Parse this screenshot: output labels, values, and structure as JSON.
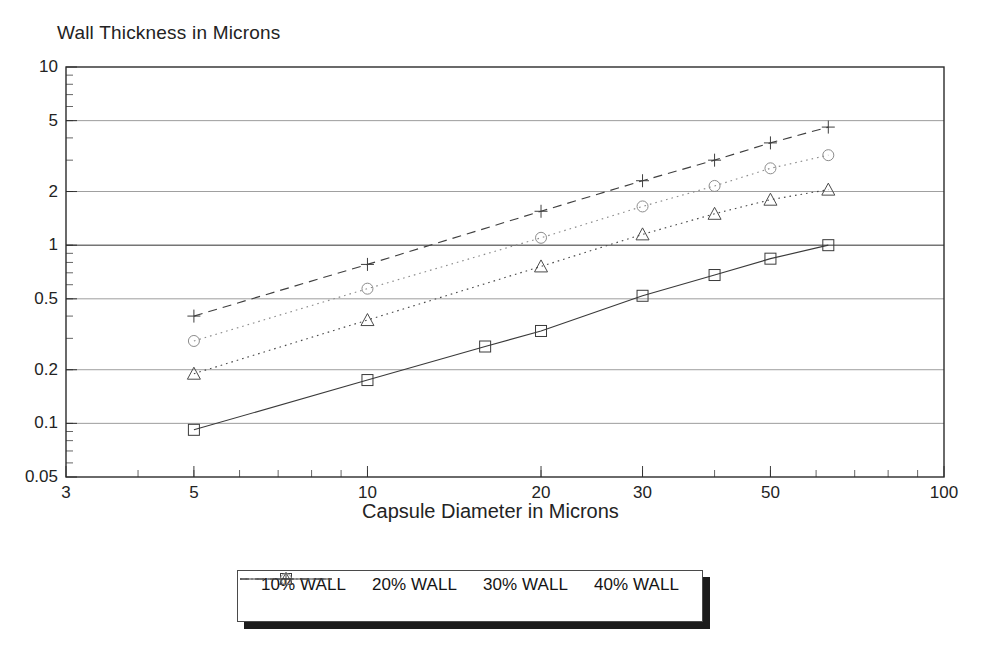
{
  "chart_data": {
    "type": "line",
    "title": "Wall Thickness in Microns",
    "xlabel": "Capsule Diameter in Microns",
    "ylabel": "Wall Thickness in Microns",
    "xscale": "log",
    "yscale": "log",
    "xlim": [
      3,
      100
    ],
    "ylim": [
      0.05,
      10
    ],
    "grid": true,
    "legend_position": "below-center",
    "xticks": [
      3,
      5,
      10,
      20,
      30,
      50,
      100
    ],
    "xtick_labels": [
      "3",
      "5",
      "10",
      "20",
      "30",
      "50",
      "100"
    ],
    "yticks": [
      0.05,
      0.1,
      0.2,
      0.5,
      1,
      2,
      5,
      10
    ],
    "ytick_labels": [
      "0.05",
      "0.1",
      "0.2",
      "0.5",
      "1",
      "2",
      "5",
      "10"
    ],
    "series": [
      {
        "name": "10% WALL",
        "marker": "square",
        "linestyle": "solid",
        "color": "#3a3a3a",
        "x": [
          5,
          10,
          16,
          20,
          30,
          40,
          50,
          63
        ],
        "y": [
          0.092,
          0.175,
          0.27,
          0.33,
          0.52,
          0.68,
          0.84,
          1.0
        ]
      },
      {
        "name": "20% WALL",
        "marker": "triangle",
        "linestyle": "dotted",
        "color": "#4a4a4a",
        "x": [
          5,
          10,
          20,
          30,
          40,
          50,
          63
        ],
        "y": [
          0.19,
          0.38,
          0.76,
          1.15,
          1.5,
          1.8,
          2.05
        ]
      },
      {
        "name": "30% WALL",
        "marker": "circle",
        "linestyle": "dotted",
        "color": "#8c8c8c",
        "x": [
          5,
          10,
          20,
          30,
          40,
          50,
          63
        ],
        "y": [
          0.29,
          0.57,
          1.1,
          1.65,
          2.15,
          2.7,
          3.2
        ]
      },
      {
        "name": "40% WALL",
        "marker": "plus",
        "linestyle": "dashed",
        "color": "#3f3f3f",
        "x": [
          5,
          10,
          20,
          30,
          40,
          50,
          63
        ],
        "y": [
          0.4,
          0.78,
          1.55,
          2.3,
          3.0,
          3.75,
          4.6
        ]
      }
    ]
  },
  "legend": {
    "items": [
      {
        "label": "10% WALL",
        "marker": "square-marker-icon",
        "linestyle": "solid"
      },
      {
        "label": "20% WALL",
        "marker": "triangle-marker-icon",
        "linestyle": "dotted"
      },
      {
        "label": "30% WALL",
        "marker": "circle-marker-icon",
        "linestyle": "dotted"
      },
      {
        "label": "40% WALL",
        "marker": "plus-marker-icon",
        "linestyle": "dashed"
      }
    ]
  },
  "colors": {
    "axis": "#2b2b2b",
    "grid": "#6e6e6e",
    "text": "#232323",
    "background": "#ffffff",
    "legend_shadow": "#1c1c1c"
  }
}
